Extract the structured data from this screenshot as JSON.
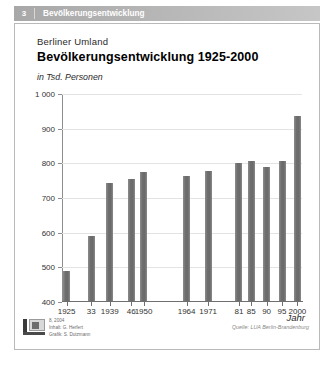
{
  "chapter": {
    "number": "3",
    "title": "Bevölkerungsentwicklung"
  },
  "titles": {
    "super": "Berliner Umland",
    "main": "Bevölkerungsentwicklung 1925-2000",
    "unit": "in Tsd. Personen"
  },
  "footer": {
    "credit_line1": "8, 2004",
    "credit_line2": "Inhalt: G. Herfert",
    "credit_line3": "Grafik: S. Dutzmann",
    "source": "Quelle: LUA Berlin-Brandenburg",
    "logo_name": "ifl-logo"
  },
  "chart_data": {
    "type": "bar",
    "title": "Bevölkerungsentwicklung 1925-2000",
    "subtitle": "Berliner Umland",
    "xlabel": "Jahr",
    "ylabel": "in Tsd. Personen",
    "ylim": [
      400,
      1000
    ],
    "ytick_step": 100,
    "yticks": [
      "1 000",
      "900",
      "800",
      "700",
      "600",
      "500",
      "400"
    ],
    "ytick_values": [
      1000,
      900,
      800,
      700,
      600,
      500,
      400
    ],
    "grid": true,
    "legend": "none",
    "categories": [
      "1925",
      "33",
      "1939",
      "46",
      "1950",
      "1964",
      "1971",
      "81",
      "85",
      "90",
      "95",
      "2000"
    ],
    "x_positions": [
      1925,
      1933,
      1939,
      1946,
      1950,
      1964,
      1971,
      1981,
      1985,
      1990,
      1995,
      2000
    ],
    "values": [
      487,
      588,
      741,
      752,
      772,
      760,
      775,
      798,
      805,
      786,
      805,
      935
    ],
    "series": [
      {
        "name": "Bevölkerung",
        "values": [
          487,
          588,
          741,
          752,
          772,
          760,
          775,
          798,
          805,
          786,
          805,
          935
        ]
      }
    ]
  }
}
